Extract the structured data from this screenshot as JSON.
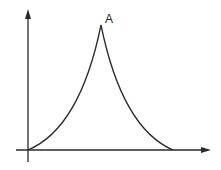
{
  "diagram": {
    "peak_label": "A",
    "colors": {
      "line": "#2a2a2a",
      "background": "#ffffff"
    },
    "axes": {
      "x_axis": "horizontal arrow",
      "y_axis": "vertical arrow"
    },
    "curve": {
      "start": [
        28,
        150
      ],
      "peak": [
        101,
        25
      ],
      "end": [
        173,
        150
      ],
      "shape": "concave-up rise to cusp, concave-up fall"
    }
  }
}
